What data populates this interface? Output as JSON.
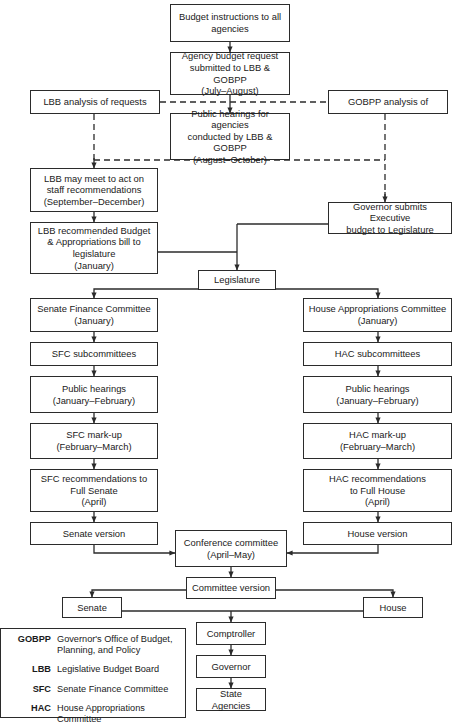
{
  "diagram": {
    "line_color": "#2b2b2b",
    "background": "#ffffff",
    "text_color": "#1a1a1a"
  },
  "nodes": {
    "budget_instructions": "Budget instructions to all agencies",
    "agency_request": "Agency budget request submitted to LBB & GOBPP (July–August)",
    "lbb_analysis": "LBB analysis of requests",
    "gobpp_analysis": "GOBPP analysis of",
    "public_hearings_agencies": "Public hearings for agencies conducted by LBB & GOBPP (August–October)",
    "lbb_meet": "LBB may meet to act on staff recommendations (September–December)",
    "lbb_recommended": "LBB recommended Budget & Appropriations bill to legislature (January)",
    "governor_submits": "Governor submits Executive budget to Legislature",
    "legislature": "Legislature",
    "sfc": "Senate Finance Committee (January)",
    "sfc_sub": "SFC subcommittees",
    "senate_public_hearings": "Public hearings (January–February)",
    "sfc_markup": "SFC mark-up (February–March)",
    "sfc_recommendations": "SFC recommendations to Full Senate (April)",
    "senate_version": "Senate version",
    "hac": "House Appropriations Committee (January)",
    "hac_sub": "HAC subcommittees",
    "house_public_hearings": "Public hearings (January–February)",
    "hac_markup": "HAC mark-up (February–March)",
    "hac_recommendations": "HAC recommendations to Full House (April)",
    "house_version": "House version",
    "conference_committee": "Conference committee (April–May)",
    "committee_version": "Committee version",
    "senate": "Senate",
    "house": "House",
    "comptroller": "Comptroller",
    "governor": "Governor",
    "state_agencies": "State Agencies"
  },
  "node_lines": {
    "budget_instructions": [
      "Budget instructions to all",
      "agencies"
    ],
    "agency_request": [
      "Agency budget request",
      "submitted to LBB & GOBPP",
      "(July–August)"
    ],
    "lbb_analysis": [
      "LBB analysis of requests"
    ],
    "gobpp_analysis": [
      "GOBPP analysis of"
    ],
    "public_hearings_agencies": [
      "Public hearings for agencies",
      "conducted by LBB & GOBPP",
      "(August–October)"
    ],
    "lbb_meet": [
      "LBB may meet to act on",
      "staff recommendations",
      "(September–December)"
    ],
    "lbb_recommended": [
      "LBB recommended Budget",
      "& Appropriations bill to",
      "legislature",
      "(January)"
    ],
    "governor_submits": [
      "Governor submits Executive",
      "budget to Legislature"
    ],
    "legislature": [
      "Legislature"
    ],
    "sfc": [
      "Senate Finance Committee",
      "(January)"
    ],
    "sfc_sub": [
      "SFC subcommittees"
    ],
    "senate_public_hearings": [
      "Public hearings",
      "(January–February)"
    ],
    "sfc_markup": [
      "SFC mark-up",
      "(February–March)"
    ],
    "sfc_recommendations": [
      "SFC recommendations to",
      "Full Senate",
      "(April)"
    ],
    "senate_version": [
      "Senate version"
    ],
    "hac": [
      "House Appropriations Committee",
      "(January)"
    ],
    "hac_sub": [
      "HAC subcommittees"
    ],
    "house_public_hearings": [
      "Public hearings",
      "(January–February)"
    ],
    "hac_markup": [
      "HAC mark-up",
      "(February–March)"
    ],
    "hac_recommendations": [
      "HAC recommendations",
      "to Full House",
      "(April)"
    ],
    "house_version": [
      "House version"
    ],
    "conference_committee": [
      "Conference committee",
      "(April–May)"
    ],
    "committee_version": [
      "Committee version"
    ],
    "senate": [
      "Senate"
    ],
    "house": [
      "House"
    ],
    "comptroller": [
      "Comptroller"
    ],
    "governor": [
      "Governor"
    ],
    "state_agencies": [
      "State Agencies"
    ]
  },
  "legend": {
    "items": [
      {
        "abbr": "GOBPP",
        "text": "Governor's Office of Budget, Planning, and Policy"
      },
      {
        "abbr": "LBB",
        "text": "Legislative Budget Board"
      },
      {
        "abbr": "SFC",
        "text": "Senate Finance Committee"
      },
      {
        "abbr": "HAC",
        "text": "House Appropriations Committee"
      }
    ],
    "items_lines": [
      [
        "Governor's Office of Budget,",
        "Planning, and Policy"
      ],
      [
        "Legislative Budget Board"
      ],
      [
        "Senate Finance Committee"
      ],
      [
        "House Appropriations Committee"
      ]
    ]
  }
}
